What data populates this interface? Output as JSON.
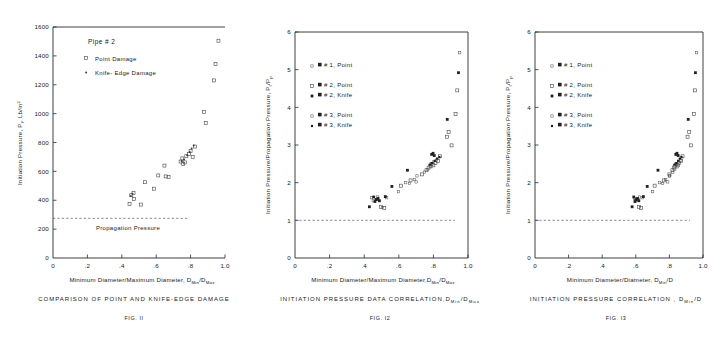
{
  "page": {
    "background": "#ffffff",
    "ink": "#1a1a1a"
  },
  "figures": [
    {
      "id": "fig-11",
      "fignum": "FIG. II",
      "caption": "COMPARISON OF POINT AND KNIFE-EDGE DAMAGE",
      "legend_title": "Pipe # 2",
      "legend": [
        {
          "label": "Point  Damage",
          "marker": "open-square"
        },
        {
          "label": "Knife- Edge Damage",
          "marker": "small-dot"
        }
      ],
      "annotation": "Propagation Pressure",
      "annotation_value": 275,
      "chart_data": {
        "type": "scatter",
        "title": "COMPARISON OF POINT AND KNIFE-EDGE DAMAGE",
        "xlabel": "Minimum Diameter/Maximum Diameter, D_Min/D_Max",
        "ylabel": "Initiation Pressure, P_I, Lb/in^2",
        "xlim": [
          0,
          1.0
        ],
        "ylim": [
          0,
          1600
        ],
        "xticks": [
          0,
          0.2,
          0.4,
          0.6,
          0.8,
          1.0
        ],
        "xticklabels": [
          "0",
          ".2",
          ".4",
          ".6",
          ".8",
          "1.0"
        ],
        "yticks": [
          0,
          200,
          400,
          600,
          800,
          1000,
          1200,
          1400,
          1600
        ],
        "yticklabels": [
          "0",
          "200",
          "400",
          "600",
          "800",
          "1000",
          "1200",
          "1400",
          "1600"
        ],
        "grid": false,
        "reference_line": {
          "label": "Propagation Pressure",
          "y": 275,
          "style": "dashed"
        },
        "series": [
          {
            "name": "Point Damage",
            "marker": "open-square",
            "points": [
              [
                0.445,
                375
              ],
              [
                0.455,
                435
              ],
              [
                0.468,
                450
              ],
              [
                0.47,
                410
              ],
              [
                0.512,
                370
              ],
              [
                0.535,
                525
              ],
              [
                0.588,
                480
              ],
              [
                0.612,
                572
              ],
              [
                0.648,
                640
              ],
              [
                0.655,
                565
              ],
              [
                0.672,
                560
              ],
              [
                0.742,
                668
              ],
              [
                0.752,
                690
              ],
              [
                0.757,
                650
              ],
              [
                0.768,
                662
              ],
              [
                0.775,
                705
              ],
              [
                0.79,
                720
              ],
              [
                0.8,
                742
              ],
              [
                0.812,
                700
              ],
              [
                0.825,
                772
              ],
              [
                0.878,
                1010
              ],
              [
                0.888,
                935
              ],
              [
                0.935,
                1230
              ],
              [
                0.945,
                1345
              ],
              [
                0.962,
                1505
              ]
            ]
          },
          {
            "name": "Knife-Edge Damage",
            "marker": "small-dot",
            "points": [
              [
                0.452,
                430
              ],
              [
                0.462,
                445
              ],
              [
                0.748,
                672
              ],
              [
                0.762,
                683
              ],
              [
                0.78,
                712
              ],
              [
                0.795,
                735
              ],
              [
                0.806,
                758
              ],
              [
                0.818,
                779
              ]
            ]
          }
        ]
      }
    },
    {
      "id": "fig-12",
      "fignum": "FIG. I2",
      "caption": "INITIATION PRESSURE DATA CORRELATION, D_Min/D_Max",
      "legend": [
        {
          "label": "# 1, Point",
          "marker": "tiny-open"
        },
        {
          "label": "# 2, Point",
          "marker": "open-square"
        },
        {
          "label": "# 2, Knife",
          "marker": "filled-square"
        },
        {
          "label": "# 3, Point",
          "marker": "tiny-open"
        },
        {
          "label": "# 3, Knife",
          "marker": "filled-small"
        }
      ],
      "chart_data": {
        "type": "scatter",
        "title": "INITIATION PRESSURE DATA CORRELATION, D_Min/D_Max",
        "xlabel": "Minimum Diameter/Maximum Diameter, D_Min/D_Max",
        "ylabel": "Initiation Pressure/Propagation Pressure, P_I/P_p",
        "xlim": [
          0,
          1.0
        ],
        "ylim": [
          0,
          6
        ],
        "xticks": [
          0,
          0.2,
          0.4,
          0.6,
          0.8,
          1.0
        ],
        "xticklabels": [
          "0",
          ".2",
          ".4",
          ".6",
          ".8",
          "1.0"
        ],
        "yticks": [
          0,
          1,
          2,
          3,
          4,
          5,
          6
        ],
        "yticklabels": [
          "0",
          "1",
          "2",
          "3",
          "4",
          "5",
          "6"
        ],
        "grid": false,
        "reference_line": {
          "label": "",
          "y": 1.0,
          "style": "dashed"
        },
        "series": [
          {
            "name": "# 1, Point",
            "marker": "tiny-open",
            "points": [
              [
                0.443,
                1.6
              ],
              [
                0.452,
                1.52
              ],
              [
                0.47,
                1.55
              ],
              [
                0.478,
                1.62
              ],
              [
                0.505,
                1.34
              ],
              [
                0.53,
                1.6
              ],
              [
                0.598,
                1.76
              ],
              [
                0.64,
                2.0
              ],
              [
                0.662,
                1.98
              ],
              [
                0.69,
                2.08
              ],
              [
                0.7,
                2.02
              ]
            ]
          },
          {
            "name": "# 2, Point",
            "marker": "open-square",
            "points": [
              [
                0.497,
                1.36
              ],
              [
                0.516,
                1.33
              ],
              [
                0.612,
                1.92
              ],
              [
                0.668,
                2.06
              ],
              [
                0.735,
                2.22
              ],
              [
                0.76,
                2.33
              ],
              [
                0.772,
                2.4
              ],
              [
                0.782,
                2.45
              ],
              [
                0.79,
                2.5
              ],
              [
                0.8,
                2.46
              ],
              [
                0.812,
                2.52
              ],
              [
                0.826,
                2.58
              ],
              [
                0.838,
                2.7
              ],
              [
                0.878,
                3.22
              ],
              [
                0.888,
                3.35
              ],
              [
                0.905,
                2.99
              ],
              [
                0.928,
                3.82
              ],
              [
                0.938,
                4.45
              ]
            ]
          },
          {
            "name": "# 2, Knife",
            "marker": "filled-square",
            "points": [
              [
                0.43,
                1.36
              ],
              [
                0.455,
                1.62
              ],
              [
                0.462,
                1.5
              ],
              [
                0.47,
                1.55
              ],
              [
                0.48,
                1.58
              ],
              [
                0.488,
                1.52
              ],
              [
                0.522,
                1.63
              ],
              [
                0.56,
                1.9
              ],
              [
                0.65,
                2.33
              ],
              [
                0.79,
                2.75
              ],
              [
                0.798,
                2.78
              ],
              [
                0.805,
                2.72
              ],
              [
                0.88,
                3.68
              ],
              [
                0.945,
                4.92
              ]
            ]
          },
          {
            "name": "# 3, Point",
            "marker": "tiny-open",
            "points": [
              [
                0.705,
                2.18
              ],
              [
                0.748,
                2.28
              ],
              [
                0.768,
                2.35
              ],
              [
                0.786,
                2.42
              ],
              [
                0.802,
                2.55
              ],
              [
                0.818,
                2.6
              ],
              [
                0.952,
                5.45
              ]
            ]
          },
          {
            "name": "# 3, Knife",
            "marker": "filled-small",
            "points": [
              [
                0.78,
                2.48
              ],
              [
                0.792,
                2.52
              ],
              [
                0.808,
                2.58
              ],
              [
                0.822,
                2.64
              ],
              [
                0.835,
                2.68
              ]
            ]
          }
        ]
      }
    },
    {
      "id": "fig-13",
      "fignum": "FIG. I3",
      "caption": "INITIATION PRESSURE CORRELATION , D_Min/D",
      "legend": [
        {
          "label": "# 1, Point",
          "marker": "tiny-open"
        },
        {
          "label": "# 2, Point",
          "marker": "open-square"
        },
        {
          "label": "# 2, Knife",
          "marker": "filled-square"
        },
        {
          "label": "# 3, Point",
          "marker": "tiny-open"
        },
        {
          "label": "# 3, Knife",
          "marker": "filled-small"
        }
      ],
      "chart_data": {
        "type": "scatter",
        "title": "INITIATION PRESSURE CORRELATION , D_Min/D",
        "xlabel": "Minimum Diameter/Diameter, D_Min/D",
        "ylabel": "Initiation Pressure/Propagation Pressure, P_I/P_p",
        "xlim": [
          0,
          1.0
        ],
        "ylim": [
          0,
          6
        ],
        "xticks": [
          0,
          0.2,
          0.4,
          0.6,
          0.8,
          1.0
        ],
        "xticklabels": [
          "0",
          ".2",
          ".4",
          ".6",
          ".8",
          "1.0"
        ],
        "yticks": [
          0,
          1,
          2,
          3,
          4,
          5,
          6
        ],
        "yticklabels": [
          "0",
          "1",
          "2",
          "3",
          "4",
          "5",
          "6"
        ],
        "grid": false,
        "reference_line": {
          "label": "",
          "y": 1.0,
          "style": "dashed"
        },
        "series": [
          {
            "name": "# 1, Point",
            "marker": "tiny-open",
            "points": [
              [
                0.592,
                1.58
              ],
              [
                0.6,
                1.52
              ],
              [
                0.612,
                1.55
              ],
              [
                0.622,
                1.62
              ],
              [
                0.638,
                1.6
              ],
              [
                0.7,
                1.76
              ],
              [
                0.742,
                2.0
              ],
              [
                0.76,
                1.98
              ],
              [
                0.778,
                2.08
              ],
              [
                0.79,
                2.02
              ],
              [
                0.8,
                2.18
              ]
            ]
          },
          {
            "name": "# 2, Point",
            "marker": "open-square",
            "points": [
              [
                0.618,
                1.36
              ],
              [
                0.632,
                1.33
              ],
              [
                0.712,
                1.92
              ],
              [
                0.768,
                2.06
              ],
              [
                0.8,
                2.22
              ],
              [
                0.818,
                2.33
              ],
              [
                0.826,
                2.4
              ],
              [
                0.834,
                2.45
              ],
              [
                0.842,
                2.5
              ],
              [
                0.85,
                2.46
              ],
              [
                0.858,
                2.52
              ],
              [
                0.868,
                2.58
              ],
              [
                0.878,
                2.7
              ],
              [
                0.908,
                3.22
              ],
              [
                0.918,
                3.35
              ],
              [
                0.928,
                2.99
              ],
              [
                0.945,
                3.82
              ],
              [
                0.952,
                4.45
              ]
            ]
          },
          {
            "name": "# 2, Knife",
            "marker": "filled-square",
            "points": [
              [
                0.578,
                1.36
              ],
              [
                0.588,
                1.62
              ],
              [
                0.595,
                1.5
              ],
              [
                0.602,
                1.55
              ],
              [
                0.61,
                1.58
              ],
              [
                0.618,
                1.52
              ],
              [
                0.645,
                1.63
              ],
              [
                0.668,
                1.9
              ],
              [
                0.732,
                2.33
              ],
              [
                0.838,
                2.75
              ],
              [
                0.845,
                2.78
              ],
              [
                0.852,
                2.72
              ],
              [
                0.912,
                3.68
              ],
              [
                0.955,
                4.92
              ]
            ]
          },
          {
            "name": "# 3, Point",
            "marker": "tiny-open",
            "points": [
              [
                0.802,
                2.18
              ],
              [
                0.82,
                2.28
              ],
              [
                0.832,
                2.35
              ],
              [
                0.845,
                2.42
              ],
              [
                0.856,
                2.55
              ],
              [
                0.868,
                2.6
              ],
              [
                0.962,
                5.45
              ]
            ]
          },
          {
            "name": "# 3, Knife",
            "marker": "filled-small",
            "points": [
              [
                0.832,
                2.48
              ],
              [
                0.842,
                2.52
              ],
              [
                0.852,
                2.58
              ],
              [
                0.862,
                2.64
              ],
              [
                0.872,
                2.68
              ]
            ]
          }
        ]
      }
    }
  ]
}
